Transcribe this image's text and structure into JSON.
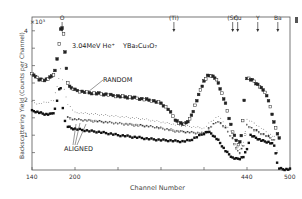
{
  "chart_data": {
    "type": "scatter",
    "beam_label": "3.04MeV He⁺",
    "target_label": "YBa₂Cu₃O₇",
    "xlabel": "Channel Number",
    "ylabel": "Backscattering Yield (Counts per Channel)",
    "y_multiplier": "×10³",
    "xlim": [
      140,
      500
    ],
    "ylim": [
      0,
      4.4
    ],
    "xticks": [
      140,
      200,
      440,
      500
    ],
    "xtick_minor": [
      260,
      320,
      380
    ],
    "yticks": [
      1,
      2,
      3,
      4
    ],
    "grid": false,
    "element_markers": [
      {
        "label": "O",
        "channel": 182
      },
      {
        "label": "(Ti)",
        "channel": 338
      },
      {
        "label": "(Sr)",
        "channel": 420
      },
      {
        "label": "Cu",
        "channel": 427
      },
      {
        "label": "Y",
        "channel": 455
      },
      {
        "label": "Ba",
        "channel": 483
      }
    ],
    "annotations": [
      {
        "text": "RANDOM",
        "x": 236,
        "y": 2.55
      },
      {
        "text": "ALIGNED",
        "x": 200,
        "y": 0.75
      }
    ],
    "series": [
      {
        "name": "RANDOM",
        "marker": "open-square-filled",
        "x": [
          140,
          145,
          150,
          155,
          160,
          165,
          170,
          172,
          175,
          178,
          180,
          182,
          184,
          186,
          188,
          190,
          195,
          200,
          210,
          220,
          230,
          240,
          250,
          260,
          270,
          280,
          290,
          300,
          310,
          320,
          330,
          340,
          345,
          350,
          355,
          360,
          365,
          370,
          375,
          380,
          385,
          390,
          395,
          400,
          405,
          410,
          415,
          420,
          425,
          428,
          430,
          432,
          434,
          436,
          440,
          445,
          450,
          455,
          460,
          465,
          470,
          475,
          480,
          485
        ],
        "y": [
          2.75,
          2.7,
          2.6,
          2.58,
          2.6,
          2.65,
          2.75,
          2.85,
          3.2,
          3.6,
          4.05,
          4.1,
          3.9,
          3.4,
          2.9,
          2.5,
          2.35,
          2.3,
          2.25,
          2.22,
          2.2,
          2.18,
          2.15,
          2.12,
          2.1,
          2.08,
          2.05,
          2.02,
          1.98,
          1.92,
          1.75,
          1.45,
          1.35,
          1.32,
          1.35,
          1.45,
          1.7,
          2.0,
          2.3,
          2.55,
          2.7,
          2.72,
          2.65,
          2.5,
          2.2,
          1.9,
          1.5,
          1.1,
          0.85,
          0.75,
          0.8,
          1.0,
          1.4,
          2.0,
          2.65,
          2.6,
          2.55,
          2.45,
          2.35,
          2.25,
          2.0,
          1.6,
          1.2,
          0.9
        ]
      },
      {
        "name": "Intermediate (dotted)",
        "marker": "small-dot",
        "x": [
          140,
          150,
          160,
          170,
          175,
          180,
          185,
          190,
          200,
          220,
          240,
          260,
          280,
          300,
          320,
          340,
          360,
          380,
          390,
          400,
          410,
          420,
          425,
          430,
          435,
          440,
          450,
          460,
          470,
          478,
          482
        ],
        "y": [
          1.95,
          1.9,
          1.95,
          2.0,
          2.4,
          2.9,
          2.3,
          1.9,
          1.65,
          1.62,
          1.58,
          1.54,
          1.5,
          1.45,
          1.38,
          1.3,
          1.25,
          1.2,
          1.4,
          1.55,
          1.3,
          1.05,
          0.7,
          0.6,
          0.8,
          1.45,
          1.35,
          1.2,
          1.05,
          0.95,
          0.55
        ]
      },
      {
        "name": "Intermediate (dashed)",
        "marker": "small-open-square",
        "x": [
          190,
          200,
          220,
          240,
          260,
          280,
          300,
          320,
          340,
          360,
          380,
          390,
          400,
          410,
          420,
          425,
          430,
          435,
          440,
          450,
          460,
          470,
          478,
          482
        ],
        "y": [
          1.5,
          1.45,
          1.42,
          1.38,
          1.34,
          1.3,
          1.26,
          1.2,
          1.12,
          1.08,
          1.05,
          1.25,
          1.4,
          1.2,
          0.9,
          0.6,
          0.5,
          0.7,
          1.3,
          1.15,
          1.05,
          0.95,
          0.85,
          0.5
        ]
      },
      {
        "name": "ALIGNED",
        "marker": "filled-square",
        "x": [
          140,
          145,
          150,
          155,
          160,
          165,
          170,
          172,
          175,
          178,
          180,
          183,
          186,
          190,
          195,
          200,
          210,
          220,
          230,
          240,
          250,
          260,
          270,
          280,
          290,
          300,
          310,
          320,
          330,
          340,
          350,
          360,
          370,
          380,
          385,
          390,
          395,
          400,
          405,
          410,
          415,
          420,
          425,
          430,
          435,
          440,
          445,
          450,
          455,
          460,
          465,
          470,
          475,
          478,
          480,
          482,
          485,
          490,
          495,
          500
        ],
        "y": [
          1.7,
          1.68,
          1.65,
          1.62,
          1.6,
          1.6,
          1.65,
          1.75,
          2.0,
          2.3,
          2.35,
          1.8,
          1.4,
          1.25,
          1.2,
          1.18,
          1.15,
          1.12,
          1.1,
          1.07,
          1.04,
          1.0,
          0.98,
          0.95,
          0.93,
          0.9,
          0.88,
          0.86,
          0.85,
          0.83,
          0.82,
          0.85,
          0.95,
          1.05,
          1.1,
          1.05,
          0.95,
          0.85,
          0.7,
          0.55,
          0.45,
          0.35,
          0.32,
          0.33,
          0.38,
          0.6,
          1.0,
          0.95,
          0.9,
          0.85,
          0.82,
          0.8,
          0.75,
          0.7,
          0.5,
          0.2,
          0.05,
          0.02,
          0.02,
          0.02
        ]
      }
    ]
  }
}
